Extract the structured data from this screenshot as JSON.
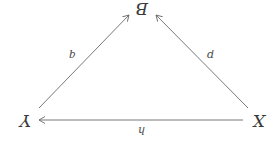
{
  "diagram": {
    "type": "commutative-triangle",
    "orientation": "rotated-180deg",
    "nodes": {
      "X": "X",
      "Y": "Y",
      "B": "B"
    },
    "arrows": {
      "h": {
        "label": "h",
        "from": "X",
        "to": "Y"
      },
      "p": {
        "label": "p",
        "from": "X",
        "to": "B"
      },
      "q": {
        "label": "q",
        "from": "Y",
        "to": "B"
      }
    },
    "colors": {
      "line": "#6a6a6a",
      "text": "#3a3a3a",
      "background": "#ffffff"
    }
  }
}
